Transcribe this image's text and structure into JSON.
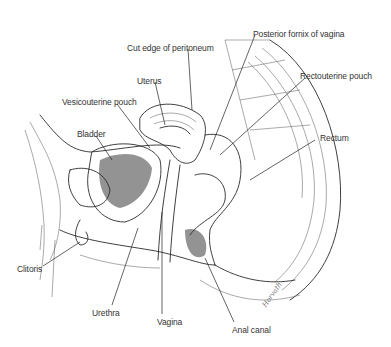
{
  "figure": {
    "labels": [
      {
        "id": "cut-edge-of-peritoneum",
        "text": "Cut edge of peritoneum",
        "x": 127,
        "y": 43
      },
      {
        "id": "posterior-fornix-of-vagina",
        "text": "Posterior fornix of vagina",
        "x": 253,
        "y": 29
      },
      {
        "id": "uterus",
        "text": "Uterus",
        "x": 137,
        "y": 76
      },
      {
        "id": "rectouterine-pouch",
        "text": "Rectouterine pouch",
        "x": 300,
        "y": 71
      },
      {
        "id": "vesicouterine-pouch",
        "text": "Vesicouterine pouch",
        "x": 62,
        "y": 97
      },
      {
        "id": "bladder",
        "text": "Bladder",
        "x": 77,
        "y": 129
      },
      {
        "id": "rectum",
        "text": "Rectum",
        "x": 320,
        "y": 133
      },
      {
        "id": "clitoris",
        "text": "Clitoris",
        "x": 17,
        "y": 264
      },
      {
        "id": "urethra",
        "text": "Urethra",
        "x": 92,
        "y": 308
      },
      {
        "id": "vagina",
        "text": "Vagina",
        "x": 157,
        "y": 317
      },
      {
        "id": "anal-canal",
        "text": "Anal canal",
        "x": 232,
        "y": 325
      }
    ],
    "signature": "Horvath"
  }
}
